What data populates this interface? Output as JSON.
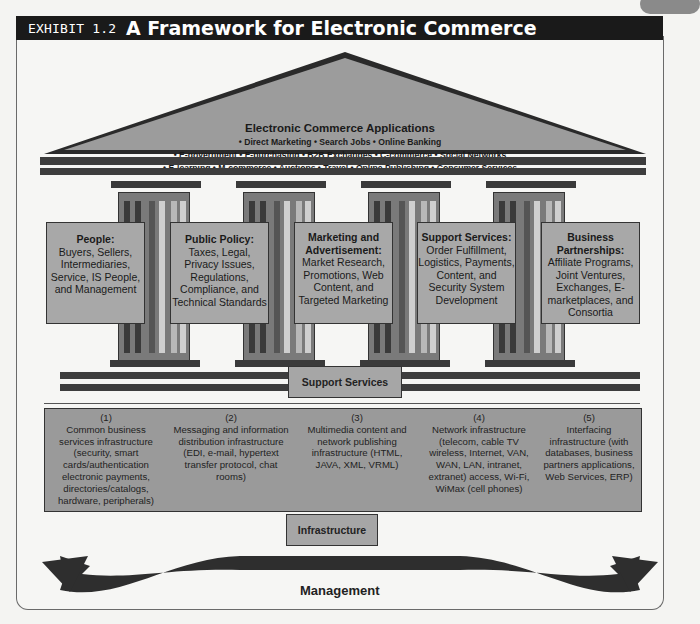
{
  "header": {
    "exhibit": "EXHIBIT 1.2",
    "title": "A Framework for Electronic Commerce"
  },
  "roof": {
    "title": "Electronic Commerce Applications",
    "lines": [
      "• Direct Marketing • Search Jobs • Online Banking",
      "• E-government • E-purchasing • B2B Exchanges • C-commerce • Social Networks",
      "• E-learning • M-commerce • Auctions • Travel • Online Publishing • Consumer Services"
    ]
  },
  "pillars": [
    {
      "heading": "People:",
      "body": "Buyers, Sellers, Intermediaries, Service, IS People, and Management"
    },
    {
      "heading": "Public Policy:",
      "body": "Taxes, Legal, Privacy Issues, Regulations, Compliance, and Technical Standards"
    },
    {
      "heading": "Marketing and Advertisement:",
      "body": "Market Research, Promotions, Web Content, and Targeted Marketing"
    },
    {
      "heading": "Support Services:",
      "body": "Order Fulfillment, Logistics, Payments, Content, and Security System Development"
    },
    {
      "heading": "Business Partnerships:",
      "body": "Affiliate Programs, Joint Ventures, Exchanges, E-marketplaces, and Consortia"
    }
  ],
  "support_services_label": "Support Services",
  "infrastructure": [
    {
      "num": "(1)",
      "text": "Common business services infrastructure (security, smart cards/authentication electronic payments, directories/catalogs, hardware, peripherals)"
    },
    {
      "num": "(2)",
      "text": "Messaging and information distribution infrastructure (EDI, e-mail, hypertext transfer protocol, chat rooms)"
    },
    {
      "num": "(3)",
      "text": "Multimedia content and network publishing infrastructure (HTML, JAVA, XML, VRML)"
    },
    {
      "num": "(4)",
      "text": "Network infrastructure (telecom, cable TV wireless, Internet, VAN, WAN, LAN, intranet, extranet) access, Wi-Fi, WiMax (cell phones)"
    },
    {
      "num": "(5)",
      "text": "Interfacing infrastructure (with databases, business partners applications, Web Services, ERP)"
    }
  ],
  "infrastructure_label": "Infrastructure",
  "management_label": "Management"
}
